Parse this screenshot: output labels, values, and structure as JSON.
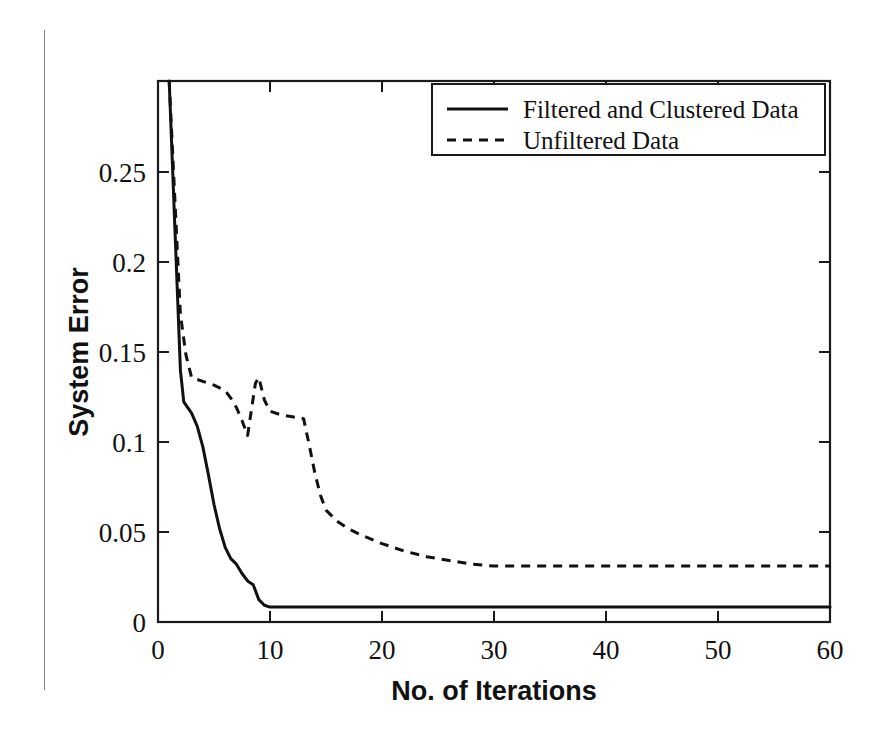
{
  "chart_data": {
    "type": "line",
    "title": "",
    "subtitle": "",
    "xlabel": "No. of Iterations",
    "ylabel": "System Error",
    "xlim": [
      0,
      60
    ],
    "ylim": [
      0,
      0.29
    ],
    "xticks": [
      0,
      10,
      20,
      30,
      40,
      50,
      60
    ],
    "xtick_labels": [
      "0",
      "10",
      "20",
      "30",
      "40",
      "50",
      "60"
    ],
    "yticks": [
      0,
      0.05,
      0.1,
      0.15,
      0.2,
      0.25
    ],
    "ytick_labels": [
      "0",
      "0.05",
      "0.1",
      "0.15",
      "0.2",
      "0.25"
    ],
    "grid": false,
    "legend_position": "upper right",
    "legend_entries": [
      "Filtered and Clustered Data",
      "Unfiltered Data"
    ],
    "series": [
      {
        "name": "Filtered and Clustered Data",
        "style": "solid",
        "color": "#111111",
        "x": [
          1,
          2,
          2.3,
          3,
          3.5,
          4,
          4.5,
          5,
          5.5,
          6,
          6.5,
          7,
          7.5,
          8,
          8.5,
          9,
          9.5,
          10,
          12,
          15,
          20,
          25,
          30,
          35,
          40,
          45,
          50,
          55,
          60
        ],
        "y": [
          0.29,
          0.135,
          0.118,
          0.112,
          0.105,
          0.094,
          0.079,
          0.063,
          0.05,
          0.04,
          0.034,
          0.031,
          0.026,
          0.022,
          0.02,
          0.012,
          0.009,
          0.008,
          0.008,
          0.008,
          0.008,
          0.008,
          0.008,
          0.008,
          0.008,
          0.008,
          0.008,
          0.008,
          0.008
        ]
      },
      {
        "name": "Unfiltered Data",
        "style": "dashed",
        "color": "#111111",
        "x": [
          1,
          2,
          2.5,
          3,
          4,
          5,
          6,
          6.5,
          7,
          7.5,
          8,
          8.3,
          8.7,
          9,
          9.5,
          10,
          11,
          12,
          13,
          13.5,
          14,
          14.5,
          15,
          16,
          17,
          18,
          20,
          22,
          24,
          26,
          28,
          30,
          35,
          40,
          45,
          50,
          55,
          60
        ],
        "y": [
          0.29,
          0.165,
          0.143,
          0.131,
          0.129,
          0.127,
          0.124,
          0.12,
          0.115,
          0.108,
          0.1,
          0.112,
          0.128,
          0.131,
          0.119,
          0.113,
          0.111,
          0.11,
          0.109,
          0.095,
          0.08,
          0.068,
          0.06,
          0.054,
          0.05,
          0.047,
          0.042,
          0.038,
          0.035,
          0.033,
          0.031,
          0.03,
          0.03,
          0.03,
          0.03,
          0.03,
          0.03,
          0.03
        ]
      }
    ]
  },
  "axes": {
    "x_title": "No. of Iterations",
    "y_title": "System Error",
    "x_tick_labels": [
      "0",
      "10",
      "20",
      "30",
      "40",
      "50",
      "60"
    ],
    "y_tick_labels": [
      "0",
      "0.05",
      "0.1",
      "0.15",
      "0.2",
      "0.25"
    ]
  },
  "legend": {
    "items": [
      {
        "label": "Filtered and Clustered Data",
        "style": "solid"
      },
      {
        "label": "Unfiltered Data",
        "style": "dashed"
      }
    ]
  },
  "colors": {
    "line": "#111111",
    "frame": "#1a1a1a",
    "background": "#ffffff",
    "page_edge": "#8a8a8a"
  }
}
